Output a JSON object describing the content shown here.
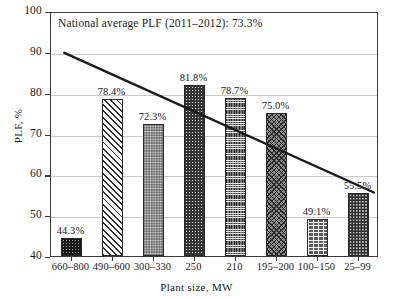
{
  "chart_data": {
    "type": "bar",
    "title": "",
    "xlabel": "Plant size, MW",
    "ylabel": "PLF, %",
    "categories": [
      "660–800",
      "490–600",
      "300–330",
      "250",
      "210",
      "195–200",
      "100–150",
      "25–99"
    ],
    "values": [
      44.3,
      78.4,
      72.3,
      81.8,
      78.7,
      75.0,
      49.1,
      55.5
    ],
    "value_labels": [
      "44.3%",
      "78.4%",
      "72.3%",
      "81.8%",
      "78.7%",
      "75.0%",
      "49.1%",
      "55.5%"
    ],
    "bar_patterns": [
      "dense-dark-stipple",
      "diagonal-hatch",
      "medium-stipple",
      "dark-dense-stipple",
      "fine-crosshatch-grid",
      "diagonal-crosshatch",
      "brick",
      "dark-stipple"
    ],
    "ylim": [
      40,
      100
    ],
    "ytick_labels": [
      "40",
      "50",
      "60",
      "70",
      "80",
      "90",
      "100"
    ],
    "ytick_values": [
      40,
      50,
      60,
      70,
      80,
      90,
      100
    ],
    "grid": true,
    "grid_axis": "y",
    "legend": "none",
    "annotations": [
      {
        "text": "National average PLF (2011–2012): 73.3%",
        "value": 73.3
      }
    ],
    "trendline": {
      "type": "linear",
      "start": {
        "x_category_index": -0.15,
        "y": 90.0
      },
      "end": {
        "x_category_index": 7.4,
        "y": 55.8
      },
      "color": "#1a1a1a"
    }
  },
  "colors": {
    "axis": "#3a3a3a",
    "grid": "#c9c9c9",
    "text": "#1a1a1a",
    "bar_outline": "#2b2b2b",
    "trendline": "#1a1a1a"
  }
}
